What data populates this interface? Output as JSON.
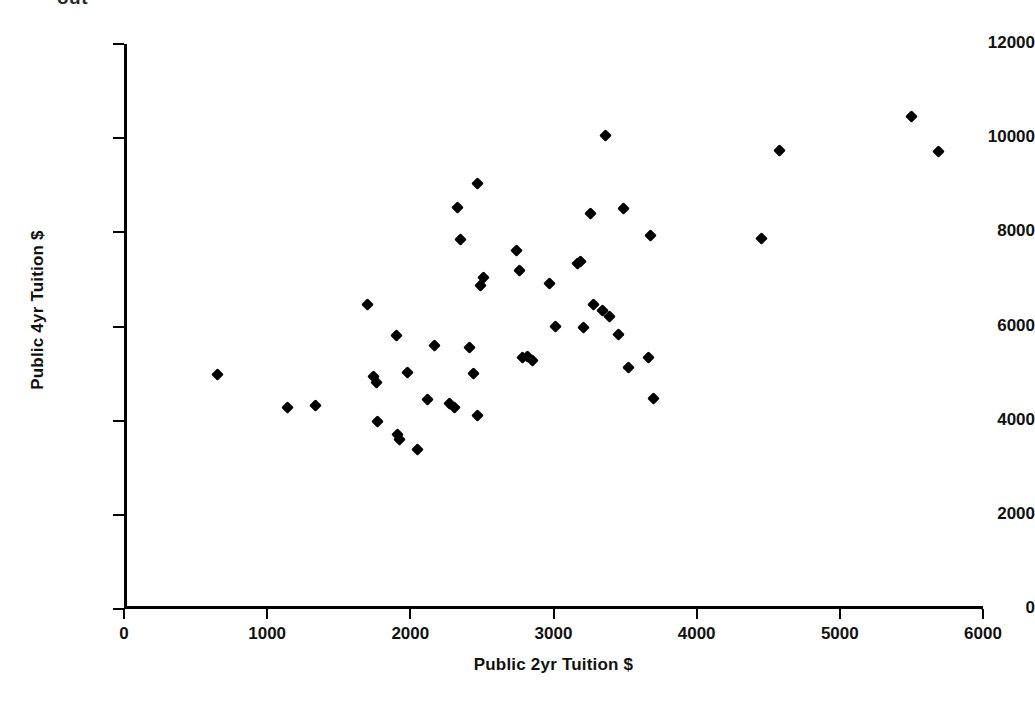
{
  "figure": {
    "top_fragment_text": "out",
    "marker_shape": "diamond",
    "marker_color": "#000000",
    "background_color": "#ffffff",
    "axis_color": "#000000"
  },
  "chart_data": {
    "type": "scatter",
    "title": "",
    "xlabel": "Public 2yr Tuition $",
    "ylabel": "Public 4yr Tuition $",
    "xlim": [
      0,
      6000
    ],
    "ylim": [
      0,
      12000
    ],
    "xticks": [
      0,
      1000,
      2000,
      3000,
      4000,
      5000,
      6000
    ],
    "yticks": [
      0,
      2000,
      4000,
      6000,
      8000,
      10000,
      12000
    ],
    "xtick_labels": [
      "0",
      "1000",
      "2000",
      "3000",
      "4000",
      "5000",
      "6000"
    ],
    "ytick_labels": [
      "0",
      "2000",
      "4000",
      "6000",
      "8000",
      "10000",
      "12000"
    ],
    "grid": false,
    "legend": false,
    "series": [
      {
        "name": "States",
        "marker": "diamond",
        "color": "#000000",
        "points": [
          [
            630,
            4970
          ],
          [
            1120,
            4290
          ],
          [
            1320,
            4330
          ],
          [
            1680,
            6460
          ],
          [
            1720,
            4930
          ],
          [
            1740,
            4820
          ],
          [
            1750,
            3990
          ],
          [
            1880,
            5800
          ],
          [
            1890,
            3700
          ],
          [
            1900,
            3590
          ],
          [
            1960,
            5030
          ],
          [
            2030,
            3380
          ],
          [
            2100,
            4440
          ],
          [
            2150,
            5590
          ],
          [
            2250,
            4360
          ],
          [
            2290,
            4270
          ],
          [
            2310,
            8530
          ],
          [
            2330,
            7850
          ],
          [
            2390,
            5560
          ],
          [
            2420,
            5010
          ],
          [
            2450,
            9030
          ],
          [
            2450,
            4100
          ],
          [
            2470,
            6880
          ],
          [
            2490,
            7040
          ],
          [
            2720,
            7610
          ],
          [
            2740,
            7200
          ],
          [
            2760,
            5340
          ],
          [
            2800,
            5360
          ],
          [
            2830,
            5270
          ],
          [
            2950,
            6910
          ],
          [
            2990,
            6010
          ],
          [
            3150,
            7330
          ],
          [
            3170,
            7390
          ],
          [
            3190,
            5970
          ],
          [
            3240,
            8400
          ],
          [
            3260,
            6460
          ],
          [
            3320,
            6330
          ],
          [
            3340,
            10050
          ],
          [
            3370,
            6220
          ],
          [
            3430,
            5840
          ],
          [
            3470,
            8510
          ],
          [
            3500,
            5130
          ],
          [
            3640,
            5340
          ],
          [
            3660,
            7930
          ],
          [
            3680,
            4470
          ],
          [
            4430,
            7860
          ],
          [
            4560,
            9730
          ],
          [
            5480,
            10470
          ],
          [
            5670,
            9720
          ]
        ]
      }
    ]
  }
}
